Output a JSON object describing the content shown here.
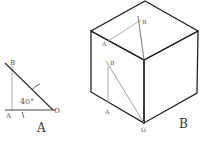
{
  "figure_a": {
    "caption": "A",
    "angle_label": "40°",
    "points": {
      "B": "B",
      "A": "A",
      "O": "O"
    }
  },
  "figure_b": {
    "caption": "B",
    "top_face_points": {
      "A": "A",
      "B": "B"
    },
    "left_face_points": {
      "A": "A",
      "B": "B"
    },
    "vertex_label": "O"
  },
  "colors": {
    "edge": "#222222",
    "thin_line": "#888888",
    "label": "#555555"
  }
}
